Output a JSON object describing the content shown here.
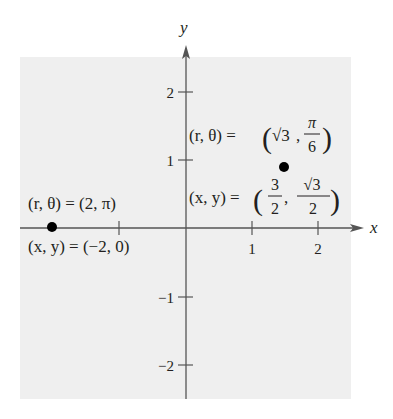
{
  "figure": {
    "background_color": "#efefef",
    "axis_color": "#555555",
    "point_color": "#000000",
    "x_axis_label": "x",
    "y_axis_label": "y",
    "x_ticks": [
      {
        "value": -1,
        "label": ""
      },
      {
        "value": 1,
        "label": "1"
      },
      {
        "value": 2,
        "label": "2"
      }
    ],
    "y_ticks": [
      {
        "value": 2,
        "label": "2"
      },
      {
        "value": 1,
        "label": "1"
      },
      {
        "value": -1,
        "label": "−1"
      },
      {
        "value": -2,
        "label": "−2"
      }
    ],
    "points": [
      {
        "name": "point-a",
        "polar_label": "(r, θ) = (√3, π/6)",
        "rect_label": "(x, y) = (3/2, √3/2)",
        "x": 1.5,
        "y": 0.866
      },
      {
        "name": "point-b",
        "polar_label": "(r, θ) = (2, π)",
        "rect_label": "(x, y) = (−2, 0)",
        "x": -2,
        "y": 0
      }
    ]
  },
  "labels": {
    "y": "y",
    "x": "x",
    "tick_x1": "1",
    "tick_x2": "2",
    "tick_y2": "2",
    "tick_y1": "1",
    "tick_ym1": "−1",
    "tick_ym2": "−2",
    "pa_polar_lhs": "(r, θ) = ",
    "pa_polar_r": "√3",
    "pa_polar_num": "π",
    "pa_polar_den": "6",
    "pa_rect_lhs": "(x, y) = ",
    "pa_rect_num1": "3",
    "pa_rect_den1": "2",
    "pa_rect_num2": "√3",
    "pa_rect_den2": "2",
    "pb_polar": "(r, θ) = (2, π)",
    "pb_rect": "(x, y) = (−2, 0)"
  }
}
